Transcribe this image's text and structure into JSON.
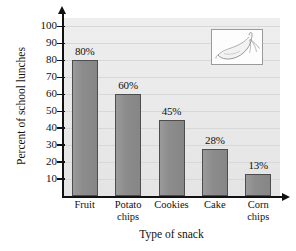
{
  "chart_data": {
    "type": "bar",
    "title": "",
    "xlabel": "Type of snack",
    "ylabel": "Percent of school lunches",
    "categories": [
      "Fruit",
      "Potato chips",
      "Cookies",
      "Cake",
      "Corn chips"
    ],
    "category_lines": [
      [
        "Fruit"
      ],
      [
        "Potato",
        "chips"
      ],
      [
        "Cookies"
      ],
      [
        "Cake"
      ],
      [
        "Corn",
        "chips"
      ]
    ],
    "values": [
      80,
      60,
      45,
      28,
      13
    ],
    "data_labels": [
      "80%",
      "60%",
      "45%",
      "28%",
      "13%"
    ],
    "ylim": [
      0,
      105
    ],
    "ytick_values": [
      10,
      20,
      30,
      40,
      50,
      60,
      70,
      80,
      90,
      100
    ],
    "ytick_labels": [
      "10",
      "20",
      "30",
      "40",
      "50",
      "60",
      "70",
      "80",
      "90",
      "100"
    ],
    "grid": true,
    "legend": "none",
    "bar_color": "#8f8f8f",
    "bar_border_color": "#4d4d4d",
    "plot_background": "#ececec",
    "axis_color": "#111111",
    "gridline_color": "#d8d8d8"
  },
  "inset": {
    "name": "banana-illustration",
    "border_color": "#9a9a9a",
    "background": "#fdfdfd"
  }
}
